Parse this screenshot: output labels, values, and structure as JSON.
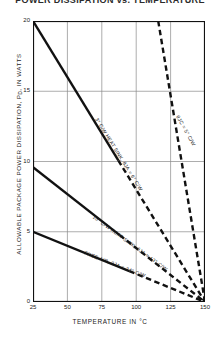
{
  "chart_data": {
    "type": "line",
    "title": "POWER DISSIPATION vs. TEMPERATURE",
    "xlabel": "TEMPERATURE IN °C",
    "ylabel": "ALLOWABLE PACKAGE POWER DISSIPATION, P",
    "ylabel_sub": "D",
    "ylabel_tail": ", IN WATTS",
    "xlim": [
      25,
      150
    ],
    "ylim": [
      0,
      20
    ],
    "grid": true,
    "legend_position": "inline-labels",
    "xticks": [
      "25",
      "50",
      "75",
      "100",
      "125",
      "150"
    ],
    "xtick_values": [
      25,
      50,
      75,
      100,
      125,
      150
    ],
    "yticks": [
      "0",
      "5",
      "10",
      "15",
      "20"
    ],
    "ytick_values": [
      0,
      5,
      10,
      15,
      20
    ],
    "convergence_point": {
      "x": 150,
      "y": 0
    },
    "series": [
      {
        "name": "3°C/W HEAT SINK",
        "label": "3° C/W HEAT SINK, θJA = 6° C/W",
        "theta_ja": "6° C/W",
        "style": "solid-then-dashed",
        "color": "#111111",
        "x": [
          25,
          150
        ],
        "y": [
          20,
          0
        ],
        "solid_until_x": 87,
        "label_x": 70,
        "label_y": 13.0,
        "label_angle": 58
      },
      {
        "name": "θJC = 5°C/W",
        "label": "θJC = 5° C/W",
        "theta_jc": "5° C/W",
        "style": "dashed",
        "color": "#111111",
        "x": [
          116,
          150
        ],
        "y": [
          20,
          0
        ],
        "solid_until_x": 116,
        "label_x": 129,
        "label_y": 13.2,
        "label_angle": 61
      },
      {
        "name": "10°C/W HEAT SINK",
        "label": "10° C/W HEAT SINK, θJA = 13° C/W",
        "theta_ja": "13° C/W",
        "style": "solid-then-dashed",
        "color": "#111111",
        "x": [
          25,
          150
        ],
        "y": [
          9.6,
          0
        ],
        "solid_until_x": 88,
        "label_x": 68,
        "label_y": 6.0,
        "label_angle": 36
      },
      {
        "name": "FREE AIR",
        "label": "FREE AIR, θJA = 24° C/W",
        "theta_ja": "24° C/W",
        "style": "solid-then-dashed",
        "color": "#111111",
        "x": [
          25,
          150
        ],
        "y": [
          5.0,
          0
        ],
        "solid_until_x": 95,
        "label_x": 62,
        "label_y": 3.4,
        "label_angle": 21
      }
    ]
  }
}
